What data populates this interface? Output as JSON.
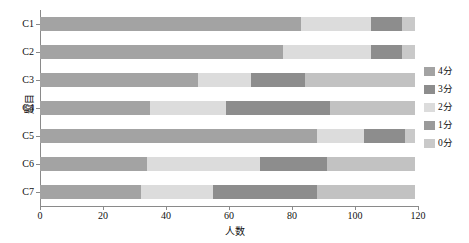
{
  "chart_data": {
    "type": "bar",
    "orientation": "horizontal",
    "stacked": true,
    "title": "",
    "xlabel": "人数",
    "ylabel": "题目",
    "xlim": [
      0,
      120
    ],
    "xticks": [
      0,
      20,
      40,
      60,
      80,
      100,
      120
    ],
    "grid": false,
    "legend_position": "right",
    "categories": [
      "C1",
      "C2",
      "C3",
      "C4",
      "C5",
      "C6",
      "C7"
    ],
    "series": [
      {
        "name": "0分",
        "color": "#b8b8b8",
        "values": [
          0,
          0,
          0,
          0,
          0,
          0,
          0
        ]
      },
      {
        "name": "1分",
        "color": "#8c8c8c",
        "values": [
          0,
          0,
          0,
          0,
          0,
          0,
          0
        ]
      },
      {
        "name": "2分",
        "color": "#d9d9d9",
        "values": [
          22,
          28,
          17,
          24,
          15,
          36,
          23
        ]
      },
      {
        "name": "3分",
        "color": "#8f8f8f",
        "values": [
          10,
          10,
          17,
          33,
          13,
          21,
          33
        ]
      },
      {
        "name": "4分",
        "color": "#a6a6a6",
        "values": [
          83,
          77,
          50,
          35,
          88,
          34,
          32
        ]
      }
    ],
    "stack_order": [
      "4分",
      "2分",
      "3分",
      "0分"
    ],
    "bars": [
      {
        "category": "C1",
        "segments": [
          {
            "label": "4分",
            "value": 83,
            "color": "#a3a3a3"
          },
          {
            "label": "2分",
            "value": 22,
            "color": "#dcdcdc"
          },
          {
            "label": "3分",
            "value": 10,
            "color": "#8d8d8d"
          },
          {
            "label": "0分",
            "value": 4,
            "color": "#c9c9c9"
          }
        ],
        "total": 119
      },
      {
        "category": "C2",
        "segments": [
          {
            "label": "4分",
            "value": 77,
            "color": "#a3a3a3"
          },
          {
            "label": "2分",
            "value": 28,
            "color": "#dcdcdc"
          },
          {
            "label": "3分",
            "value": 10,
            "color": "#8d8d8d"
          },
          {
            "label": "0分",
            "value": 4,
            "color": "#c9c9c9"
          }
        ],
        "total": 119
      },
      {
        "category": "C3",
        "segments": [
          {
            "label": "4分",
            "value": 50,
            "color": "#a3a3a3"
          },
          {
            "label": "2分",
            "value": 17,
            "color": "#dcdcdc"
          },
          {
            "label": "3分",
            "value": 17,
            "color": "#8d8d8d"
          },
          {
            "label": "0分",
            "value": 35,
            "color": "#c2c2c2"
          }
        ],
        "total": 119
      },
      {
        "category": "C4",
        "segments": [
          {
            "label": "4分",
            "value": 35,
            "color": "#a3a3a3"
          },
          {
            "label": "2分",
            "value": 24,
            "color": "#dcdcdc"
          },
          {
            "label": "3分",
            "value": 33,
            "color": "#8d8d8d"
          },
          {
            "label": "0分",
            "value": 27,
            "color": "#c2c2c2"
          }
        ],
        "total": 119
      },
      {
        "category": "C5",
        "segments": [
          {
            "label": "4分",
            "value": 88,
            "color": "#a3a3a3"
          },
          {
            "label": "2分",
            "value": 15,
            "color": "#dcdcdc"
          },
          {
            "label": "3分",
            "value": 13,
            "color": "#8d8d8d"
          },
          {
            "label": "0分",
            "value": 3,
            "color": "#c9c9c9"
          }
        ],
        "total": 119
      },
      {
        "category": "C6",
        "segments": [
          {
            "label": "4分",
            "value": 34,
            "color": "#a3a3a3"
          },
          {
            "label": "2分",
            "value": 36,
            "color": "#dcdcdc"
          },
          {
            "label": "3分",
            "value": 21,
            "color": "#8d8d8d"
          },
          {
            "label": "0分",
            "value": 28,
            "color": "#c2c2c2"
          }
        ],
        "total": 119
      },
      {
        "category": "C7",
        "segments": [
          {
            "label": "4分",
            "value": 32,
            "color": "#a3a3a3"
          },
          {
            "label": "2分",
            "value": 23,
            "color": "#dcdcdc"
          },
          {
            "label": "3分",
            "value": 33,
            "color": "#8d8d8d"
          },
          {
            "label": "0分",
            "value": 31,
            "color": "#c2c2c2"
          }
        ],
        "total": 119
      }
    ]
  },
  "legend": {
    "items": [
      {
        "label": "4分",
        "color": "#a3a3a3"
      },
      {
        "label": "3分",
        "color": "#8d8d8d"
      },
      {
        "label": "2分",
        "color": "#dcdcdc"
      },
      {
        "label": "1分",
        "color": "#9a9a9a"
      },
      {
        "label": "0分",
        "color": "#c9c9c9"
      }
    ]
  },
  "axes": {
    "x_title": "人数",
    "y_title": "题目",
    "x_tick_labels": [
      "0",
      "20",
      "40",
      "60",
      "80",
      "100",
      "120"
    ],
    "y_tick_labels": [
      "C1",
      "C2",
      "C3",
      "C4",
      "C5",
      "C6",
      "C7"
    ]
  }
}
